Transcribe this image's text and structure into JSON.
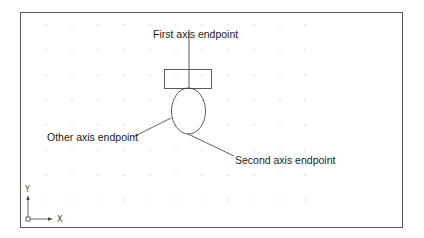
{
  "diagram": {
    "labels": {
      "first_axis": "First axis endpoint",
      "other_axis": "Other axis endpoint",
      "second_axis": "Second axis endpoint"
    },
    "ucs_icon": {
      "x_label": "X",
      "y_label": "Y"
    },
    "colors": {
      "line": "#333333",
      "border": "#555555",
      "grid_dot": "#b0b0b0",
      "background": "#ffffff"
    },
    "grid": {
      "columns": [
        46,
        72,
        98,
        124,
        150,
        176,
        202,
        228,
        254,
        280,
        305
      ],
      "rows": [
        25,
        50,
        75,
        100,
        125,
        150,
        175,
        200
      ]
    }
  }
}
